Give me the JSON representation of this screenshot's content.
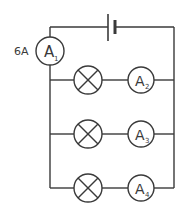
{
  "diagram": {
    "type": "circuit",
    "colors": {
      "line": "#3a3a3a",
      "background": "#ffffff"
    },
    "battery": {
      "label": ""
    },
    "main_ammeter": {
      "letter": "A",
      "subscript": "1",
      "reading": "6A"
    },
    "branches": [
      {
        "lamp": "lamp",
        "ammeter": {
          "letter": "A",
          "subscript": "2"
        }
      },
      {
        "lamp": "lamp",
        "ammeter": {
          "letter": "A",
          "subscript": "3"
        }
      },
      {
        "lamp": "lamp",
        "ammeter": {
          "letter": "A",
          "subscript": "4"
        }
      }
    ]
  }
}
